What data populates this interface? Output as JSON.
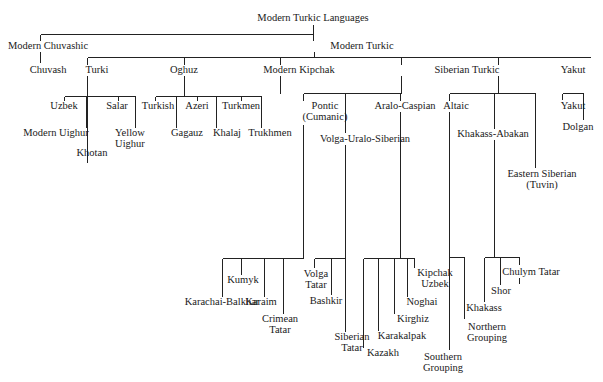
{
  "diagram": {
    "type": "tree",
    "root": "Modern Turkic Languages",
    "nodes": {
      "root": "Modern Turkic Languages",
      "chuvashic": "Modern Chuvashic",
      "chuvash": "Chuvash",
      "modern_turkic": "Modern Turkic",
      "turki": "Turki",
      "uzbek": "Uzbek",
      "modern_uighur": "Modern Uighur",
      "khotan": "Khotan",
      "salar": "Salar",
      "yellow_uighur": "Yellow\nUighur",
      "oghuz": "Oghuz",
      "turkish": "Turkish",
      "gagauz": "Gagauz",
      "azeri": "Azeri",
      "khalaj": "Khalaj",
      "turkmen": "Turkmen",
      "trukhmen": "Trukhmen",
      "kipchak": "Modern Kipchak",
      "pontic": "Pontic\n(Cumanic)",
      "karachai": "Karachai-Balkhar",
      "kumyk": "Kumyk",
      "karaim": "Karaim",
      "crimean_tatar": "Crimean\nTatar",
      "volga_ural": "Volga-Uralo-Siberian",
      "volga_tatar": "Volga\nTatar",
      "bashkir": "Bashkir",
      "siberian_tatar": "Siberian\nTatar",
      "aralo_caspian": "Aralo-Caspian",
      "kazakh": "Kazakh",
      "karakalpak": "Karakalpak",
      "kirghiz": "Kirghiz",
      "noghai": "Noghai",
      "kipchak_uzbek": "Kipchak\nUzbek",
      "siberian_turkic": "Siberian Turkic",
      "altaic": "Altaic",
      "southern_grouping": "Southern\nGrouping",
      "northern_grouping": "Northern\nGrouping",
      "khakass_abakan": "Khakass-Abakan",
      "khakass": "Khakass",
      "shor": "Shor",
      "chulym_tatar": "Chulym Tatar",
      "eastern_siberian": "Eastern Siberian\n(Tuvin)",
      "yakut_group": "Yakut",
      "yakut": "Yakut",
      "dolgan": "Dolgan"
    },
    "edges": [
      [
        "root",
        "chuvashic"
      ],
      [
        "root",
        "modern_turkic"
      ],
      [
        "chuvashic",
        "chuvash"
      ],
      [
        "modern_turkic",
        "turki"
      ],
      [
        "modern_turkic",
        "oghuz"
      ],
      [
        "modern_turkic",
        "kipchak"
      ],
      [
        "modern_turkic",
        "siberian_turkic"
      ],
      [
        "modern_turkic",
        "yakut_group"
      ],
      [
        "turki",
        "uzbek"
      ],
      [
        "turki",
        "modern_uighur"
      ],
      [
        "turki",
        "khotan"
      ],
      [
        "turki",
        "salar"
      ],
      [
        "turki",
        "yellow_uighur"
      ],
      [
        "oghuz",
        "turkish"
      ],
      [
        "oghuz",
        "gagauz"
      ],
      [
        "oghuz",
        "azeri"
      ],
      [
        "oghuz",
        "khalaj"
      ],
      [
        "oghuz",
        "turkmen"
      ],
      [
        "oghuz",
        "trukhmen"
      ],
      [
        "kipchak",
        "pontic"
      ],
      [
        "kipchak",
        "volga_ural"
      ],
      [
        "kipchak",
        "aralo_caspian"
      ],
      [
        "pontic",
        "karachai"
      ],
      [
        "pontic",
        "kumyk"
      ],
      [
        "pontic",
        "karaim"
      ],
      [
        "pontic",
        "crimean_tatar"
      ],
      [
        "volga_ural",
        "volga_tatar"
      ],
      [
        "volga_ural",
        "bashkir"
      ],
      [
        "volga_ural",
        "siberian_tatar"
      ],
      [
        "aralo_caspian",
        "kazakh"
      ],
      [
        "aralo_caspian",
        "karakalpak"
      ],
      [
        "aralo_caspian",
        "kirghiz"
      ],
      [
        "aralo_caspian",
        "noghai"
      ],
      [
        "aralo_caspian",
        "kipchak_uzbek"
      ],
      [
        "siberian_turkic",
        "altaic"
      ],
      [
        "siberian_turkic",
        "khakass_abakan"
      ],
      [
        "siberian_turkic",
        "eastern_siberian"
      ],
      [
        "altaic",
        "southern_grouping"
      ],
      [
        "altaic",
        "northern_grouping"
      ],
      [
        "khakass_abakan",
        "khakass"
      ],
      [
        "khakass_abakan",
        "shor"
      ],
      [
        "khakass_abakan",
        "chulym_tatar"
      ],
      [
        "yakut_group",
        "yakut"
      ],
      [
        "yakut_group",
        "dolgan"
      ]
    ]
  }
}
